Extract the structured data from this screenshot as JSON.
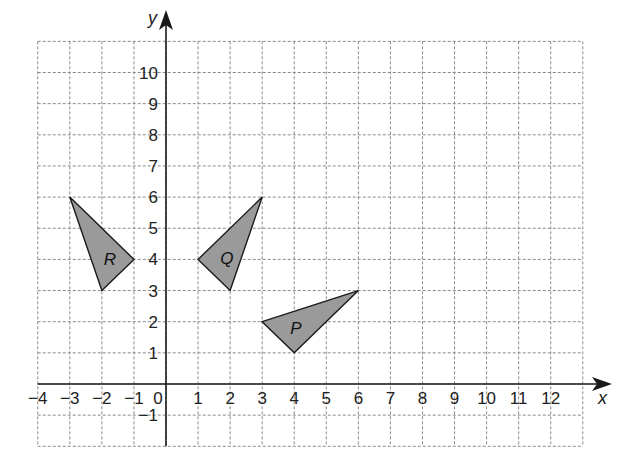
{
  "diagram": {
    "type": "coordinate-grid",
    "grid": {
      "x_min": -4,
      "x_max": 13,
      "y_min": -2,
      "y_max": 11
    },
    "axes": {
      "x_label": "x",
      "y_label": "y",
      "x_ticks": [
        -4,
        -3,
        -2,
        -1,
        0,
        1,
        2,
        3,
        4,
        5,
        6,
        7,
        8,
        9,
        10,
        11,
        12
      ],
      "y_ticks": [
        -1,
        1,
        2,
        3,
        4,
        5,
        6,
        7,
        8,
        9,
        10
      ]
    },
    "shapes": [
      {
        "name": "R",
        "vertices": [
          [
            -3,
            6
          ],
          [
            -1,
            4
          ],
          [
            -2,
            3
          ]
        ],
        "label_at": [
          -1.75,
          4
        ]
      },
      {
        "name": "Q",
        "vertices": [
          [
            3,
            6
          ],
          [
            1,
            4
          ],
          [
            2,
            3
          ]
        ],
        "label_at": [
          1.9,
          4.05
        ]
      },
      {
        "name": "P",
        "vertices": [
          [
            3,
            2
          ],
          [
            6,
            3
          ],
          [
            4,
            1
          ]
        ],
        "label_at": [
          4.05,
          1.8
        ]
      }
    ],
    "colors": {
      "shape_fill": "#9a9a9a",
      "shape_stroke": "#1a1a1a",
      "grid": "#8a8a8a",
      "axis": "#1a1a1a"
    }
  }
}
